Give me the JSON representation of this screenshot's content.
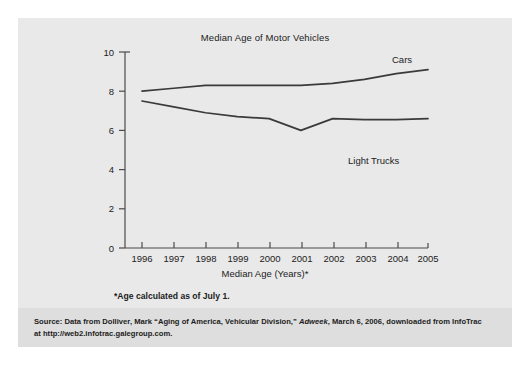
{
  "figure": {
    "title": "Median Age of Motor Vehicles",
    "xlabel": "Median Age (Years)*",
    "footnote": "*Age calculated as of July 1.",
    "source_line_1_a": "Source: Data from Dolliver, Mark “Aging of America, Vehicular Division,” ",
    "source_line_1_italic": "Adweek",
    "source_line_1_b": ", March 6, 2006, downloaded from InfoTrac",
    "source_line_2": "at http://web2.infotrac.galegroup.com."
  },
  "chart_data": {
    "type": "line",
    "title": "Median Age of Motor Vehicles",
    "xlabel": "Median Age (Years)*",
    "ylabel": "",
    "x": [
      "1996",
      "1997",
      "1998",
      "1999",
      "2000",
      "2001",
      "2002",
      "2003",
      "2004",
      "2005"
    ],
    "xlim": [
      "1996",
      "2005"
    ],
    "ylim": [
      0,
      10
    ],
    "yticks": [
      0,
      2,
      4,
      6,
      8,
      10
    ],
    "grid": false,
    "legend": "inline-labels",
    "series": [
      {
        "name": "Cars",
        "values": [
          8.0,
          8.15,
          8.3,
          8.3,
          8.3,
          8.3,
          8.4,
          8.6,
          8.9,
          9.1
        ],
        "color": "#3a3a3a",
        "label_position": "top-right"
      },
      {
        "name": "Light Trucks",
        "values": [
          7.5,
          7.2,
          6.9,
          6.7,
          6.6,
          6.0,
          6.6,
          6.55,
          6.55,
          6.6
        ],
        "color": "#3a3a3a",
        "label_position": "bottom-right"
      }
    ]
  },
  "colors": {
    "panel": "#e9e9e9",
    "source_band": "#dedede",
    "line": "#3a3a3a",
    "axis": "#4a4a4a",
    "text": "#1c1c1c"
  }
}
